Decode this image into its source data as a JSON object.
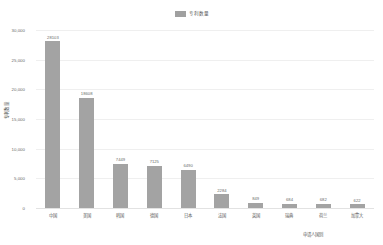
{
  "legend": {
    "entries": [
      {
        "label": "专利数量",
        "color": "#a0a0a0",
        "icon": "legend-swatch-icon"
      }
    ]
  },
  "axes": {
    "ylabel": "专利数量",
    "xlabel": "申请人国别",
    "yticks": [
      "0",
      "5,000",
      "10,000",
      "15,000",
      "20,000",
      "25,000",
      "30,000"
    ]
  },
  "chart_data": {
    "type": "bar",
    "title": "",
    "subtitle": "",
    "xlabel": "申请人国别",
    "ylabel": "专利数量",
    "legend": [
      "专利数量"
    ],
    "legend_position": "top-center",
    "grid": true,
    "ylim": [
      0,
      30000
    ],
    "ytick_values": [
      0,
      5000,
      10000,
      15000,
      20000,
      25000,
      30000
    ],
    "categories": [
      "中国",
      "美国",
      "韩国",
      "德国",
      "日本",
      "法国",
      "英国",
      "瑞典",
      "荷兰",
      "加拿大"
    ],
    "values": [
      28103,
      18608,
      7449,
      7125,
      6490,
      2284,
      849,
      684,
      682,
      622
    ],
    "value_labels": [
      "28103",
      "18608",
      "7449",
      "7125",
      "6490",
      "2284",
      "849",
      "684",
      "682",
      "622"
    ],
    "bar_color": "#a3a3a3"
  }
}
